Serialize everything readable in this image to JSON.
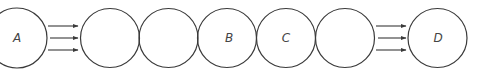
{
  "diagram": {
    "type": "chain-of-circles",
    "stroke_color": "#3a3a3a",
    "circles": [
      {
        "id": "A",
        "label": "A",
        "cx": 17,
        "cy": 38,
        "r": 30
      },
      {
        "id": "c2",
        "label": "",
        "cx": 110,
        "cy": 38,
        "r": 29.5
      },
      {
        "id": "c3",
        "label": "",
        "cx": 168.5,
        "cy": 38,
        "r": 29.5
      },
      {
        "id": "B",
        "label": "B",
        "cx": 227,
        "cy": 38,
        "r": 29.5
      },
      {
        "id": "C",
        "label": "C",
        "cx": 286,
        "cy": 38,
        "r": 29.5
      },
      {
        "id": "c6",
        "label": "",
        "cx": 345,
        "cy": 38,
        "r": 29.5
      },
      {
        "id": "D",
        "label": "D",
        "cx": 437.5,
        "cy": 38,
        "r": 29.5
      }
    ],
    "arrow_groups": [
      {
        "from": "A",
        "to": "c2",
        "x1": 48,
        "x2": 78,
        "ys": [
          26,
          38,
          50
        ]
      },
      {
        "from": "c6",
        "to": "D",
        "x1": 376,
        "x2": 406,
        "ys": [
          26,
          38,
          50
        ]
      }
    ],
    "labels": {
      "a": "A",
      "b": "B",
      "c": "C",
      "d": "D"
    }
  }
}
